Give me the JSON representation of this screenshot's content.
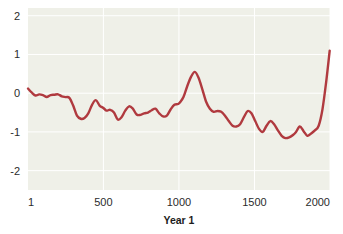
{
  "chart_data": {
    "type": "line",
    "title": "",
    "subtitle": "",
    "xlabel": "Year 1",
    "ylabel": "",
    "xlim": [
      1,
      2000
    ],
    "ylim": [
      -2.5,
      2.2
    ],
    "grid": true,
    "legend": null,
    "plot_background": "#eff0e8",
    "line_color": "#b03a3f",
    "line_width": 2.4,
    "gridline_color": "#ffffff",
    "x_ticks": [
      1,
      500,
      1000,
      1500,
      2000
    ],
    "x_tick_labels": [
      "1",
      "500",
      "1000",
      "1500",
      "2000"
    ],
    "y_ticks": [
      2,
      1,
      0,
      -1,
      -2
    ],
    "y_tick_labels": [
      "2",
      "1",
      "0",
      "-1",
      "-2"
    ],
    "series": [
      {
        "name": "temperature-anomaly",
        "x": [
          1,
          25,
          50,
          75,
          100,
          125,
          150,
          175,
          200,
          225,
          250,
          275,
          300,
          325,
          350,
          375,
          400,
          425,
          450,
          475,
          500,
          520,
          545,
          570,
          595,
          620,
          645,
          670,
          695,
          720,
          745,
          770,
          795,
          820,
          845,
          870,
          895,
          920,
          945,
          970,
          995,
          1010,
          1030,
          1055,
          1080,
          1105,
          1130,
          1155,
          1180,
          1205,
          1230,
          1255,
          1280,
          1305,
          1330,
          1355,
          1380,
          1405,
          1430,
          1455,
          1480,
          1505,
          1530,
          1555,
          1580,
          1605,
          1630,
          1655,
          1680,
          1705,
          1730,
          1755,
          1775,
          1800,
          1825,
          1850,
          1875,
          1900,
          1925,
          1950,
          1975,
          1998
        ],
        "y": [
          0.12,
          0.02,
          -0.06,
          -0.03,
          -0.05,
          -0.1,
          -0.05,
          -0.04,
          -0.03,
          -0.08,
          -0.1,
          -0.12,
          -0.32,
          -0.58,
          -0.66,
          -0.64,
          -0.52,
          -0.3,
          -0.18,
          -0.32,
          -0.38,
          -0.45,
          -0.43,
          -0.5,
          -0.68,
          -0.62,
          -0.45,
          -0.34,
          -0.4,
          -0.55,
          -0.56,
          -0.52,
          -0.5,
          -0.44,
          -0.4,
          -0.52,
          -0.6,
          -0.58,
          -0.42,
          -0.3,
          -0.28,
          -0.22,
          -0.1,
          0.18,
          0.42,
          0.55,
          0.4,
          0.1,
          -0.22,
          -0.4,
          -0.48,
          -0.46,
          -0.48,
          -0.58,
          -0.72,
          -0.84,
          -0.86,
          -0.8,
          -0.62,
          -0.46,
          -0.52,
          -0.72,
          -0.92,
          -1.0,
          -0.84,
          -0.72,
          -0.8,
          -0.96,
          -1.1,
          -1.16,
          -1.14,
          -1.08,
          -1.0,
          -0.86,
          -0.98,
          -1.1,
          -1.04,
          -0.96,
          -0.84,
          -0.42,
          0.3,
          1.1
        ]
      }
    ]
  },
  "axes": {
    "x_axis_title": "Year 1",
    "y_axis_title": ""
  }
}
